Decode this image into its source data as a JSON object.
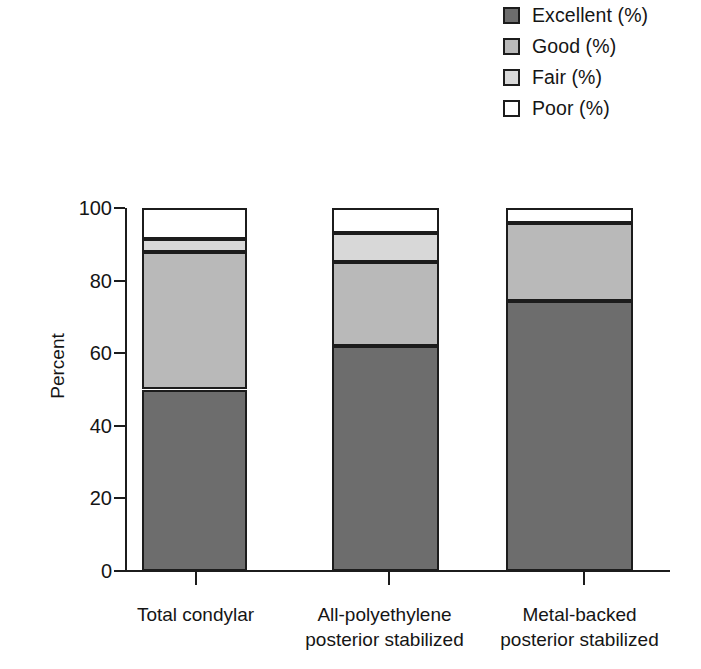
{
  "legend": {
    "position": "top-right",
    "items": [
      {
        "label": "Excellent (%)",
        "color": "#6d6d6d",
        "name": "excellent"
      },
      {
        "label": "Good (%)",
        "color": "#b9b9b9",
        "name": "good"
      },
      {
        "label": "Fair (%)",
        "color": "#d8d8d8",
        "name": "fair"
      },
      {
        "label": "Poor (%)",
        "color": "#ffffff",
        "name": "poor"
      }
    ]
  },
  "axes": {
    "ylabel": "Percent",
    "yticks": [
      "0",
      "20",
      "40",
      "60",
      "80",
      "100"
    ],
    "ylim": [
      0,
      100
    ],
    "xlabel": ""
  },
  "categories_display": [
    {
      "line1": "Total condylar",
      "line2": ""
    },
    {
      "line1": "All-polyethylene",
      "line2": "posterior stabilized"
    },
    {
      "line1": "Metal-backed",
      "line2": "posterior stabilized"
    }
  ],
  "chart_data": {
    "type": "bar",
    "subtype": "stacked-bar",
    "title": "",
    "xlabel": "",
    "ylabel": "Percent",
    "ylim": [
      0,
      100
    ],
    "yticks": [
      0,
      20,
      40,
      60,
      80,
      100
    ],
    "grid": false,
    "legend_position": "top-right",
    "categories": [
      "Total condylar",
      "All-polyethylene posterior stabilized",
      "Metal-backed posterior stabilized"
    ],
    "series": [
      {
        "name": "Excellent (%)",
        "color": "#6d6d6d",
        "values": [
          50,
          62,
          74.5
        ]
      },
      {
        "name": "Good (%)",
        "color": "#b9b9b9",
        "values": [
          38,
          23,
          21.5
        ]
      },
      {
        "name": "Fair (%)",
        "color": "#d8d8d8",
        "values": [
          3.5,
          8,
          0
        ]
      },
      {
        "name": "Poor (%)",
        "color": "#ffffff",
        "values": [
          8.5,
          7,
          4
        ]
      }
    ]
  }
}
